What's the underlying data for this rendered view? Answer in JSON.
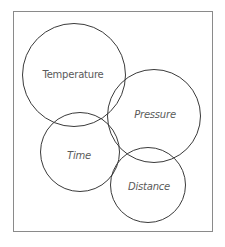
{
  "diagram": {
    "type": "venn-style overlapping circles",
    "frame_color": "#8a8a8a",
    "circle_stroke_color": "#3a3a3a",
    "label_color": "#5a5a5a",
    "circles": [
      {
        "label": "Temperature",
        "cx": 74,
        "cy": 75,
        "r": 52,
        "italic": false
      },
      {
        "label": "Pressure",
        "cx": 154,
        "cy": 116,
        "r": 47,
        "italic": true
      },
      {
        "label": "Time",
        "cx": 80,
        "cy": 152,
        "r": 40,
        "italic": true
      },
      {
        "label": "Distance",
        "cx": 148,
        "cy": 185,
        "r": 38,
        "italic": true
      }
    ]
  }
}
